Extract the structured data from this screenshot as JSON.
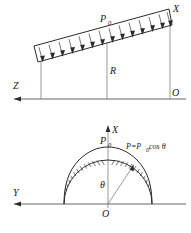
{
  "figure": {
    "domain": "engineering-mechanics-diagram",
    "background_color": "#ffffff",
    "line_color": "#2b2b2b",
    "axis_color": "#555555",
    "label_color": "#1a1a1a",
    "panels": [
      {
        "id": "upper",
        "description": "Inclined straight member carrying a uniformly distributed load P0 directed downward, with vertical projection lines to the horizontal Z axis.",
        "labels": {
          "load": "P",
          "load_subscript": "0",
          "axis_right": "X",
          "axis_left": "Z",
          "origin": "O",
          "radius": "R"
        },
        "load_arrow_count": 14,
        "load_direction": "down",
        "load_distribution": "uniform"
      },
      {
        "id": "lower",
        "description": "Semicircular arch of radius R with a cosine-distributed radial load P = P0 cos(theta), measured from the vertical X axis.",
        "labels": {
          "load": "P",
          "load_subscript": "0",
          "axis_up": "X",
          "axis_left": "Y",
          "origin": "O",
          "angle": "θ",
          "formula": "P=P",
          "formula_subscript": "0",
          "formula_tail": "cos θ"
        },
        "load_distribution": "cosine",
        "radial_tick_count": 20,
        "arch_span_degrees": 180
      }
    ]
  }
}
